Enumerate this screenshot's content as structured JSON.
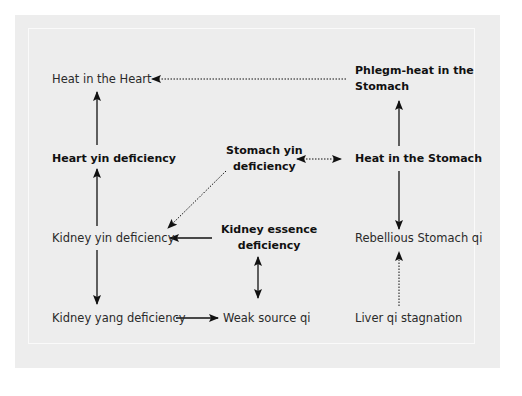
{
  "diagram": {
    "nodes": [
      {
        "id": "heat-heart",
        "label": "Heat in the Heart",
        "bold": false
      },
      {
        "id": "phlegm-heat-stomach",
        "label_line1": "Phlegm-heat in the",
        "label_line2": "Stomach",
        "bold": true
      },
      {
        "id": "heart-yin-def",
        "label": "Heart yin deficiency",
        "bold": true
      },
      {
        "id": "stomach-yin-def",
        "label_line1": "Stomach yin",
        "label_line2": "deficiency",
        "bold": true
      },
      {
        "id": "heat-stomach",
        "label": "Heat in the Stomach",
        "bold": true
      },
      {
        "id": "kidney-yin-def",
        "label": "Kidney yin deficiency",
        "bold": false
      },
      {
        "id": "kidney-essence-def",
        "label_line1": "Kidney essence",
        "label_line2": "deficiency",
        "bold": true
      },
      {
        "id": "rebellious-stomach-qi",
        "label": "Rebellious Stomach qi",
        "bold": false
      },
      {
        "id": "kidney-yang-def",
        "label": "Kidney yang deficiency",
        "bold": false
      },
      {
        "id": "weak-source-qi",
        "label": "Weak source qi",
        "bold": false
      },
      {
        "id": "liver-qi-stagnation",
        "label": "Liver qi stagnation",
        "bold": false
      }
    ],
    "edges": [
      {
        "from": "phlegm-heat-stomach",
        "to": "heat-heart",
        "style": "dotted"
      },
      {
        "from": "heart-yin-def",
        "to": "heat-heart",
        "style": "solid"
      },
      {
        "from": "kidney-yin-def",
        "to": "heart-yin-def",
        "style": "solid"
      },
      {
        "from": "stomach-yin-def",
        "to": "heat-stomach",
        "style": "dotted",
        "bidirectional": true
      },
      {
        "from": "stomach-yin-def",
        "to": "kidney-yin-def",
        "style": "dotted"
      },
      {
        "from": "heat-stomach",
        "to": "phlegm-heat-stomach",
        "style": "solid"
      },
      {
        "from": "heat-stomach",
        "to": "rebellious-stomach-qi",
        "style": "solid"
      },
      {
        "from": "kidney-essence-def",
        "to": "kidney-yin-def",
        "style": "solid"
      },
      {
        "from": "kidney-essence-def",
        "to": "weak-source-qi",
        "style": "solid",
        "bidirectional": true
      },
      {
        "from": "kidney-yin-def",
        "to": "kidney-yang-def",
        "style": "solid"
      },
      {
        "from": "kidney-yang-def",
        "to": "weak-source-qi",
        "style": "solid"
      },
      {
        "from": "liver-qi-stagnation",
        "to": "rebellious-stomach-qi",
        "style": "dotted"
      }
    ]
  },
  "colors": {
    "background": "#ffffff",
    "panel": "#ededed",
    "frame_line": "#fafafa",
    "arrow": "#111111"
  }
}
